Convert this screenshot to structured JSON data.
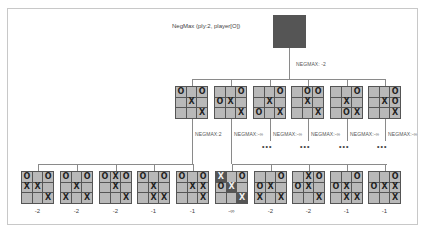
{
  "title": "NegMax (ply:2, player[O])",
  "root": {
    "board": [
      "",
      "",
      "O",
      "",
      "X",
      "",
      "",
      "",
      "X"
    ],
    "label": "NEGMAX: -2"
  },
  "ply1": [
    {
      "board": [
        "O",
        "",
        "O",
        "",
        "X",
        "",
        "",
        "",
        "X"
      ],
      "label": "NEGMAX:2"
    },
    {
      "board": [
        "",
        "",
        "O",
        "O",
        "X",
        "",
        "",
        "",
        "X"
      ],
      "label": "NEGMAX:-∞"
    },
    {
      "board": [
        "",
        "",
        "O",
        "",
        "X",
        "",
        "O",
        "",
        "X"
      ],
      "label": "NEGMAX:-∞",
      "dots": "•••"
    },
    {
      "board": [
        "",
        "O",
        "O",
        "",
        "X",
        "",
        "",
        "",
        "X"
      ],
      "label": "NEGMAX:-∞",
      "dots": "•••"
    },
    {
      "board": [
        "",
        "",
        "O",
        "",
        "X",
        "",
        "",
        "O",
        "X"
      ],
      "label": "NEGMAX:-∞",
      "dots": "•••"
    },
    {
      "board": [
        "",
        "",
        "O",
        "",
        "X",
        "O",
        "",
        "",
        "X"
      ],
      "label": "NEGMAX:-∞",
      "dots": "•••"
    }
  ],
  "ply2": [
    {
      "board": [
        "O",
        "",
        "O",
        "X",
        "X",
        "",
        "",
        "",
        "X"
      ],
      "score": "-2"
    },
    {
      "board": [
        "O",
        "",
        "O",
        "",
        "X",
        "",
        "X",
        "",
        "X"
      ],
      "score": "-2"
    },
    {
      "board": [
        "O",
        "X",
        "O",
        "",
        "X",
        "",
        "",
        "",
        "X"
      ],
      "score": "-2"
    },
    {
      "board": [
        "O",
        "",
        "O",
        "",
        "X",
        "",
        "",
        "X",
        "X"
      ],
      "score": "-1"
    },
    {
      "board": [
        "O",
        "",
        "O",
        "",
        "X",
        "X",
        "",
        "",
        "X"
      ],
      "score": "-1"
    },
    {
      "board": [
        "X",
        "",
        "O",
        "O",
        "X",
        "",
        "",
        "",
        "X"
      ],
      "score": "-∞",
      "highlight": [
        0,
        4,
        8
      ]
    },
    {
      "board": [
        "",
        "",
        "O",
        "O",
        "X",
        "",
        "X",
        "",
        "X"
      ],
      "score": "-2"
    },
    {
      "board": [
        "",
        "X",
        "O",
        "O",
        "X",
        "",
        "",
        "",
        "X"
      ],
      "score": "-2"
    },
    {
      "board": [
        "",
        "",
        "O",
        "O",
        "X",
        "",
        "",
        "X",
        "X"
      ],
      "score": "-1"
    },
    {
      "board": [
        "",
        "",
        "O",
        "O",
        "X",
        "X",
        "",
        "",
        "X"
      ],
      "score": "-1"
    }
  ],
  "colors": {
    "cell": "#b9b9b9",
    "cell_highlight": "#555555",
    "grid": "#555555",
    "connector": "#8a8a8a"
  }
}
